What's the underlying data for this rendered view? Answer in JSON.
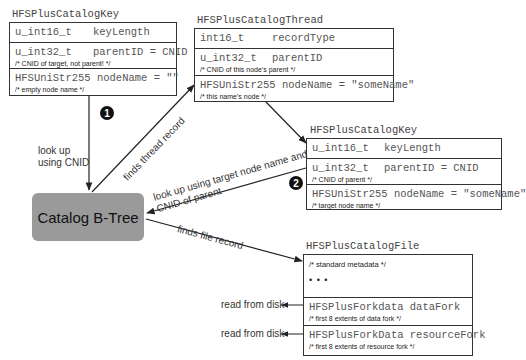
{
  "key1": {
    "title": "HFSPlusCatalogKey",
    "rows": [
      {
        "type": "u_int16_t",
        "field": "keyLength",
        "comment": ""
      },
      {
        "type": "u_int32_t",
        "field": "parentID = CNID",
        "comment": "/* CNID of target, not parent! */"
      },
      {
        "type": "HFSUniStr255",
        "field": "nodeName = \"\"",
        "comment": "/* empty node name */"
      }
    ]
  },
  "thread": {
    "title": "HFSPlusCatalogThread",
    "rows": [
      {
        "type": "int16_t",
        "field": "recordType",
        "comment": ""
      },
      {
        "type": "u_int32_t",
        "field": "parentID",
        "comment": "/* CNID of this node's parent */"
      },
      {
        "type": "HFSUniStr255",
        "field": "nodeName = \"someName\"",
        "comment": "/* this name's node */"
      }
    ]
  },
  "key2": {
    "title": "HFSPlusCatalogKey",
    "rows": [
      {
        "type": "u_int16_t",
        "field": "keyLength",
        "comment": ""
      },
      {
        "type": "u_int32_t",
        "field": "parentID = CNID",
        "comment": "/* CNID of parent */"
      },
      {
        "type": "HFSUniStr255",
        "field": "nodeName = \"someName\"",
        "comment": "/* target node name */"
      }
    ]
  },
  "file": {
    "title": "HFSPlusCatalogFile",
    "metadata_comment": "/* standard metadata */",
    "ellipsis": "• • •",
    "rows": [
      {
        "code": "HFSPlusForkdata dataFork",
        "comment": "/* first 8 extents of data fork */"
      },
      {
        "code": "HFSPlusForkData resourceFork",
        "comment": "/* first 8 extents of resource fork */"
      }
    ]
  },
  "btree": {
    "label": "Catalog B-Tree"
  },
  "steps": {
    "one": "1",
    "two": "2"
  },
  "labels": {
    "lookup_cnid": [
      "look up",
      "using CNID"
    ],
    "finds_thread": "finds thread record",
    "lookup_name": [
      "look up using target node name and",
      "CNID of parent"
    ],
    "finds_file": "finds file record",
    "read_disk_1": "read from disk",
    "read_disk_2": "read from disk"
  }
}
